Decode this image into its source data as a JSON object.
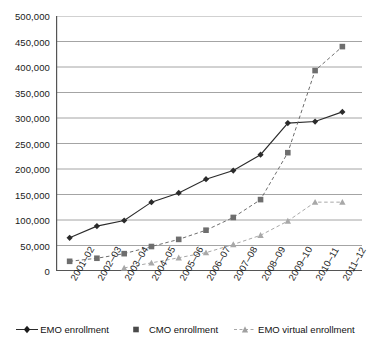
{
  "chart_data": {
    "type": "line",
    "title": "",
    "subtitle": "",
    "xlabel": "",
    "ylabel": "",
    "ylim": [
      0,
      500000
    ],
    "ytick_interval": 50000,
    "grid": true,
    "legend_position": "bottom",
    "categories": [
      "2001–02",
      "2002–03",
      "2003–04",
      "2004–05",
      "2005–06",
      "2006–07",
      "2007–08",
      "2008–09",
      "2009–10",
      "2010–11",
      "2011–12"
    ],
    "ytick_labels": [
      "500,000",
      "450,000",
      "400,000",
      "350,000",
      "300,000",
      "250,000",
      "200,000",
      "150,000",
      "100,000",
      "50,000",
      "0"
    ],
    "ytick_values": [
      500000,
      450000,
      400000,
      350000,
      300000,
      250000,
      200000,
      150000,
      100000,
      50000,
      0
    ],
    "series": [
      {
        "name": "EMO enrollment",
        "marker": "diamond",
        "line_style": "solid",
        "color": "#2b2b2b",
        "values": [
          65000,
          88000,
          99000,
          135000,
          153000,
          180000,
          197000,
          228000,
          290000,
          293000,
          312000
        ]
      },
      {
        "name": "CMO enrollment",
        "marker": "square",
        "line_style": "dashed",
        "color": "#6e6e6e",
        "values": [
          19000,
          25000,
          34000,
          48000,
          62000,
          80000,
          105000,
          140000,
          232000,
          393000,
          440000
        ]
      },
      {
        "name": "EMO virtual enrollment",
        "marker": "triangle",
        "line_style": "dashed",
        "color": "#a8a8a8",
        "values": [
          null,
          null,
          6000,
          16000,
          26000,
          36000,
          52000,
          70000,
          98000,
          135000,
          135000
        ]
      }
    ]
  },
  "legend": {
    "items": [
      {
        "label": "EMO enrollment"
      },
      {
        "label": "CMO enrollment"
      },
      {
        "label": "EMO virtual enrollment"
      }
    ]
  },
  "colors": {
    "gridline": "#8d8d8d",
    "axis": "#555555",
    "emo": "#2b2b2b",
    "cmo": "#6e6e6e",
    "virtual": "#a8a8a8",
    "background": "#ffffff"
  }
}
